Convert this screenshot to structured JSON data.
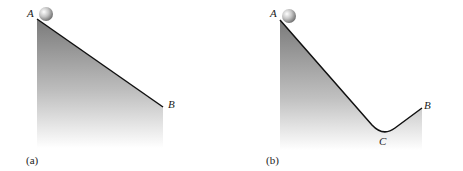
{
  "panels": [
    {
      "caption": "(a)",
      "points": {
        "A": "A",
        "B": "B"
      },
      "description": "Ball at point A on a straight incline descending to point B"
    },
    {
      "caption": "(b)",
      "points": {
        "A": "A",
        "B": "B",
        "C": "C"
      },
      "description": "Ball at point A on a track descending to valley C then rising to B"
    }
  ],
  "colors": {
    "fill_top": "#808080",
    "fill_bottom": "#ffffff",
    "line": "#111111",
    "ball": "#b0b0b0"
  }
}
